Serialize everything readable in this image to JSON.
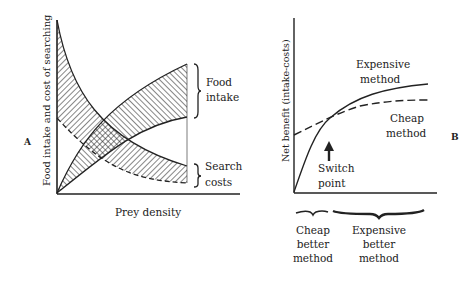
{
  "panel_a": {
    "label": "A",
    "y_axis_label": "Food intake and cost of searching",
    "x_axis_label": "Prey density",
    "food_label_line1": "Food",
    "food_label_line2": "intake",
    "search_label_line1": "Search",
    "search_label_line2": "costs"
  },
  "panel_b": {
    "label": "B",
    "y_axis_label": "Net benefit (intake-costs)",
    "expensive_line1": "Expensive",
    "expensive_line2": "method",
    "cheap_line1": "Cheap",
    "cheap_line2": "method",
    "switch_line1": "Switch",
    "switch_line2": "point",
    "bottom_left_line1": "Cheap",
    "bottom_left_line2": "better",
    "bottom_left_line3": "method",
    "bottom_right_line1": "Expensive",
    "bottom_right_line2": "better",
    "bottom_right_line3": "method"
  },
  "colors": {
    "ink": "#222222",
    "background": "#ffffff"
  }
}
